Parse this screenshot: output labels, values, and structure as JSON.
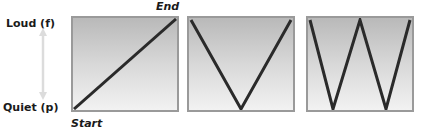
{
  "axis": {
    "top_label": "Loud (f)",
    "bottom_label": "Quiet (p)",
    "arrow": "double-headed-vertical-arrow",
    "arrow_color": "#dcdcdc"
  },
  "annotations": {
    "end_label": "End",
    "start_label": "Start"
  },
  "panels": [
    {
      "name": "crescendo",
      "shape": "rising-diagonal",
      "points": [
        [
          0,
          1
        ],
        [
          1,
          0
        ]
      ]
    },
    {
      "name": "v-shape",
      "shape": "v",
      "points": [
        [
          0,
          0
        ],
        [
          0.5,
          1
        ],
        [
          1,
          0
        ]
      ]
    },
    {
      "name": "w-shape",
      "shape": "w",
      "points": [
        [
          0,
          0
        ],
        [
          0.25,
          1
        ],
        [
          0.5,
          0
        ],
        [
          0.75,
          1
        ],
        [
          1,
          0
        ]
      ]
    }
  ],
  "colors": {
    "line": "#2a2a2a",
    "panel_border": "#9a9a9a",
    "panel_gradient_top": "#b9b9b9",
    "panel_gradient_bottom": "#f2f2f2"
  }
}
